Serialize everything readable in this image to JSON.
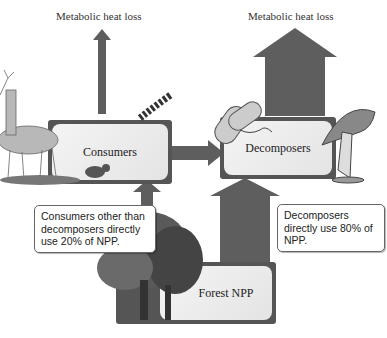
{
  "title_left": "Metabolic heat loss",
  "title_right": "Metabolic heat loss",
  "nodes": {
    "consumers": "Consumers",
    "decomposers": "Decomposers",
    "forest": "Forest NPP"
  },
  "callouts": {
    "consumers": "Consumers other than decomposers directly use 20% of NPP.",
    "decomposers": "Decomposers directly use 80% of NPP."
  },
  "flows": {
    "forest_to_consumers_pct": 20,
    "forest_to_decomposers_pct": 80
  },
  "colors": {
    "arrow": "#5a5a5a",
    "box_border": "#555555",
    "box_fill": "#ececec"
  }
}
